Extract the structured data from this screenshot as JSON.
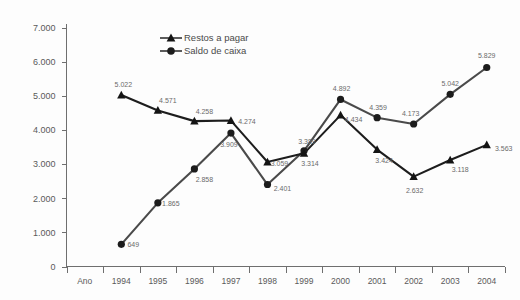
{
  "chart_data": {
    "type": "line",
    "title": "",
    "xlabel": "Ano",
    "ylabel": "",
    "categories": [
      "1994",
      "1995",
      "1996",
      "1997",
      "1998",
      "1999",
      "2000",
      "2001",
      "2002",
      "2003",
      "2004"
    ],
    "ylim": [
      0,
      7000
    ],
    "yticks": [
      0,
      1000,
      2000,
      3000,
      4000,
      5000,
      6000,
      7000
    ],
    "ytick_labels": [
      "0",
      "1.000",
      "2.000",
      "3.000",
      "4.000",
      "5.000",
      "6.000",
      "7.000"
    ],
    "grid": false,
    "legend_position": "top-center",
    "series": [
      {
        "name": "Restos a pagar",
        "marker": "triangle",
        "color": "#1d1d1d",
        "values": [
          5022,
          4571,
          4258,
          4274,
          3059,
          3314,
          4434,
          3424,
          2632,
          3118,
          3563
        ],
        "labels": [
          "5.022",
          "4.571",
          "4.258",
          "4.274",
          "3.059",
          "3.314",
          "4.434",
          "3.424",
          "2.632",
          "3.118",
          "3.563"
        ]
      },
      {
        "name": "Saldo de caixa",
        "marker": "circle",
        "color": "#4a4a4a",
        "values": [
          649,
          1865,
          2858,
          3909,
          2401,
          3389,
          4892,
          4359,
          4173,
          5042,
          5829
        ],
        "labels": [
          "649",
          "1.865",
          "2.858",
          "3.909",
          "2.401",
          "3.389",
          "4.892",
          "4.359",
          "4.173",
          "5.042",
          "5.829"
        ]
      }
    ]
  },
  "legend": {
    "items": [
      {
        "label": "Restos a pagar",
        "marker": "triangle-marker-icon"
      },
      {
        "label": "Saldo de caixa",
        "marker": "circle-marker-icon"
      }
    ]
  },
  "axis": {
    "x_origin_label": "Ano"
  }
}
